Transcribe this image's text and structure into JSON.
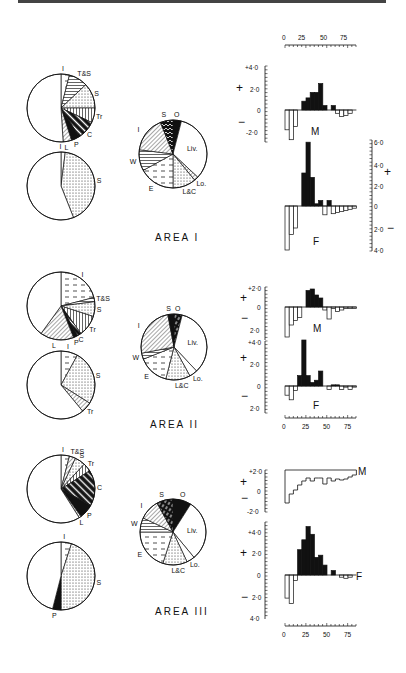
{
  "figure": {
    "areas": [
      {
        "title": "AREA I"
      },
      {
        "title": "AREA II"
      },
      {
        "title": "AREA III"
      }
    ]
  },
  "chart_data": [
    {
      "type": "pie",
      "title": "AREA I — diet pie (upper left)",
      "slices": [
        {
          "label": "I",
          "value": 4,
          "pattern": "dashes"
        },
        {
          "label": "T&S",
          "value": 9,
          "pattern": "horizontal"
        },
        {
          "label": "S",
          "value": 12,
          "pattern": "dots"
        },
        {
          "label": "Tr",
          "value": 7,
          "pattern": "vertical"
        },
        {
          "label": "C",
          "value": 9,
          "pattern": "diagonal-bold"
        },
        {
          "label": "P",
          "value": 4,
          "pattern": "solid"
        },
        {
          "label": "L",
          "value": 4,
          "pattern": "diagonal"
        },
        {
          "label": "",
          "value": 51,
          "pattern": "blank"
        }
      ]
    },
    {
      "type": "pie",
      "title": "AREA I — diet pie (lower left)",
      "slices": [
        {
          "label": "I",
          "value": 2,
          "pattern": "dashes"
        },
        {
          "label": "S",
          "value": 42,
          "pattern": "dots"
        },
        {
          "label": "",
          "value": 56,
          "pattern": "blank"
        }
      ]
    },
    {
      "type": "pie",
      "title": "AREA I — habitat pie",
      "slices": [
        {
          "label": "O",
          "value": 4,
          "pattern": "solid"
        },
        {
          "label": "Liv.",
          "value": 33,
          "pattern": "blank"
        },
        {
          "label": "Lo.",
          "value": 2,
          "pattern": "diagonal"
        },
        {
          "label": "L&C",
          "value": 11,
          "pattern": "dots"
        },
        {
          "label": "E",
          "value": 17,
          "pattern": "dashes"
        },
        {
          "label": "W",
          "value": 10,
          "pattern": "horizontal"
        },
        {
          "label": "I",
          "value": 17,
          "pattern": "diagonal"
        },
        {
          "label": "S",
          "value": 6,
          "pattern": "zigzag"
        }
      ]
    },
    {
      "type": "bar",
      "title": "AREA I — M",
      "xlabel": "",
      "ylabel": "",
      "x_ticks": [
        0,
        25,
        50,
        75
      ],
      "ylim": [
        -3.0,
        4.0
      ],
      "y_ticks": [
        "+4·0",
        "2·0",
        "0",
        "-2·0"
      ],
      "categories": [
        0,
        5,
        10,
        15,
        20,
        25,
        30,
        35,
        40,
        45,
        50,
        55,
        60,
        65,
        70,
        75,
        80
      ],
      "values": [
        -1.8,
        -2.7,
        -1.5,
        0,
        0.8,
        1.1,
        1.6,
        1.6,
        2.4,
        0.4,
        0,
        0.4,
        -0.3,
        -0.6,
        -0.5,
        -0.3,
        0
      ]
    },
    {
      "type": "bar",
      "title": "AREA I — F",
      "x_ticks": [
        0,
        25,
        50,
        75
      ],
      "ylim": [
        -4.0,
        6.0
      ],
      "y_ticks": [
        "6·0",
        "4·0",
        "2·0",
        "0",
        "2·0",
        "4·0"
      ],
      "categories": [
        0,
        5,
        10,
        15,
        20,
        25,
        30,
        35,
        40,
        45,
        50,
        55,
        60,
        65,
        70,
        75,
        80
      ],
      "values": [
        -4.0,
        -2.6,
        -2.0,
        0,
        3.0,
        5.8,
        2.6,
        0.2,
        0.5,
        -0.8,
        0.5,
        -0.7,
        -0.6,
        -0.5,
        -0.4,
        -0.3,
        -0.2
      ]
    },
    {
      "type": "pie",
      "title": "AREA II — diet pie (upper left)",
      "slices": [
        {
          "label": "I",
          "value": 21,
          "pattern": "dashes"
        },
        {
          "label": "T&S",
          "value": 2,
          "pattern": "horizontal"
        },
        {
          "label": "S",
          "value": 7,
          "pattern": "dots"
        },
        {
          "label": "Tr",
          "value": 10,
          "pattern": "vertical"
        },
        {
          "label": "C",
          "value": 2,
          "pattern": "diagonal-bold"
        },
        {
          "label": "P",
          "value": 2,
          "pattern": "solid"
        },
        {
          "label": "L",
          "value": 16,
          "pattern": "diagonal"
        },
        {
          "label": "",
          "value": 40,
          "pattern": "blank"
        }
      ]
    },
    {
      "type": "pie",
      "title": "AREA II — diet pie (lower left)",
      "slices": [
        {
          "label": "I",
          "value": 8,
          "pattern": "dashes"
        },
        {
          "label": "S",
          "value": 26,
          "pattern": "dots"
        },
        {
          "label": "Tr",
          "value": 5,
          "pattern": "diagonal"
        },
        {
          "label": "",
          "value": 61,
          "pattern": "blank"
        }
      ]
    },
    {
      "type": "pie",
      "title": "AREA II — habitat pie",
      "slices": [
        {
          "label": "O",
          "value": 4,
          "pattern": "zigzag-solid"
        },
        {
          "label": "Liv.",
          "value": 34,
          "pattern": "blank"
        },
        {
          "label": "Lo.",
          "value": 4,
          "pattern": "blank"
        },
        {
          "label": "L&C",
          "value": 12,
          "pattern": "dots"
        },
        {
          "label": "E",
          "value": 15,
          "pattern": "dashes"
        },
        {
          "label": "W",
          "value": 3,
          "pattern": "horizontal"
        },
        {
          "label": "I",
          "value": 25,
          "pattern": "diagonal"
        },
        {
          "label": "S",
          "value": 3,
          "pattern": "solid"
        }
      ]
    },
    {
      "type": "bar",
      "title": "AREA II — M",
      "x_ticks": [
        0,
        25,
        50,
        75
      ],
      "ylim": [
        -2.0,
        2.0
      ],
      "y_ticks": [
        "+2·0",
        "0",
        "2·0"
      ],
      "categories": [
        0,
        5,
        10,
        15,
        20,
        25,
        30,
        35,
        40,
        45,
        50,
        55,
        60,
        65,
        70,
        75,
        80
      ],
      "values": [
        -2.0,
        -1.2,
        -0.9,
        -0.7,
        0,
        1.1,
        1.2,
        0.8,
        0.6,
        -0.2,
        -0.8,
        -0.1,
        -0.3,
        -0.2,
        -0.1,
        -0.1,
        -0.1
      ]
    },
    {
      "type": "bar",
      "title": "AREA II — F",
      "x_ticks": [
        0,
        25,
        50,
        75
      ],
      "ylim": [
        -2.0,
        4.0
      ],
      "y_ticks": [
        "+4·0",
        "2·0",
        "0",
        "2·0"
      ],
      "categories": [
        0,
        5,
        10,
        15,
        20,
        25,
        30,
        35,
        40,
        45,
        50,
        55,
        60,
        65,
        70,
        75,
        80
      ],
      "values": [
        -0.8,
        -1.2,
        -0.4,
        0.9,
        4.0,
        0.9,
        0.3,
        0.5,
        1.3,
        0,
        -0.3,
        0.1,
        0.1,
        -0.3,
        -0.1,
        -0.3,
        -0.1
      ]
    },
    {
      "type": "pie",
      "title": "AREA III — diet pie (upper left)",
      "slices": [
        {
          "label": "I",
          "value": 4,
          "pattern": "dashes"
        },
        {
          "label": "T&S",
          "value": 3,
          "pattern": "diagonal"
        },
        {
          "label": "S",
          "value": 5,
          "pattern": "dots"
        },
        {
          "label": "Tr",
          "value": 4,
          "pattern": "vertical"
        },
        {
          "label": "C",
          "value": 17,
          "pattern": "diagonal-bold"
        },
        {
          "label": "P",
          "value": 7,
          "pattern": "solid"
        },
        {
          "label": "L",
          "value": 1,
          "pattern": "diagonal"
        },
        {
          "label": "",
          "value": 59,
          "pattern": "blank"
        }
      ]
    },
    {
      "type": "pie",
      "title": "AREA III — diet pie (lower left)",
      "slices": [
        {
          "label": "I",
          "value": 5,
          "pattern": "dashes"
        },
        {
          "label": "S",
          "value": 45,
          "pattern": "dots"
        },
        {
          "label": "P",
          "value": 4,
          "pattern": "solid"
        },
        {
          "label": "",
          "value": 46,
          "pattern": "blank"
        }
      ]
    },
    {
      "type": "pie",
      "title": "AREA III — habitat pie",
      "slices": [
        {
          "label": "O",
          "value": 9,
          "pattern": "solid"
        },
        {
          "label": "Liv.",
          "value": 30,
          "pattern": "blank"
        },
        {
          "label": "Lo.",
          "value": 4,
          "pattern": "blank"
        },
        {
          "label": "L&C",
          "value": 12,
          "pattern": "dots"
        },
        {
          "label": "E",
          "value": 20,
          "pattern": "dashes"
        },
        {
          "label": "W",
          "value": 7,
          "pattern": "horizontal"
        },
        {
          "label": "I",
          "value": 10,
          "pattern": "diagonal"
        },
        {
          "label": "S",
          "value": 8,
          "pattern": "zigzag-solid"
        }
      ]
    },
    {
      "type": "bar",
      "title": "AREA III — M",
      "x_ticks": [
        0,
        25,
        50,
        75
      ],
      "ylim": [
        -2.0,
        2.0
      ],
      "y_ticks": [
        "+2·0",
        "0",
        "-2·0"
      ],
      "categories": [
        0,
        5,
        10,
        15,
        20,
        25,
        30,
        35,
        40,
        45,
        50,
        55,
        60,
        65,
        70,
        75,
        80
      ],
      "values": [
        -1.2,
        -0.3,
        0.1,
        0.6,
        1.0,
        1.3,
        1.0,
        1.3,
        1.3,
        0.7,
        1.3,
        1.0,
        1.2,
        1.1,
        1.2,
        1.4,
        1.6
      ],
      "note": "M bars are drawn hanging from the +2·0 line"
    },
    {
      "type": "bar",
      "title": "AREA III — F",
      "x_ticks": [
        0,
        25,
        50,
        75
      ],
      "ylim": [
        -4.0,
        4.0
      ],
      "y_ticks": [
        "+4·0",
        "2·0",
        "0",
        "2·0",
        "4·0"
      ],
      "categories": [
        0,
        5,
        10,
        15,
        20,
        25,
        30,
        35,
        40,
        45,
        50,
        55,
        60,
        65,
        70,
        75,
        80
      ],
      "values": [
        -2.1,
        -2.6,
        -0.5,
        2.3,
        3.2,
        4.4,
        3.7,
        1.6,
        1.8,
        0.9,
        0,
        0.4,
        0,
        -0.2,
        -0.3,
        -0.2,
        0
      ]
    }
  ],
  "labels": {
    "plus": "+",
    "minus": "−",
    "M": "M",
    "F": "F"
  }
}
